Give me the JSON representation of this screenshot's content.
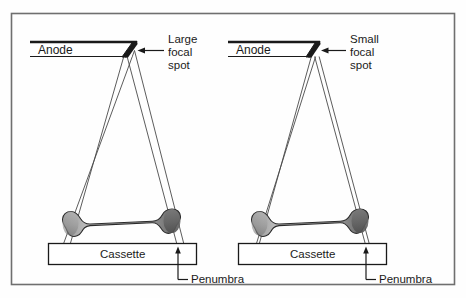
{
  "figure": {
    "type": "diagram",
    "frame": {
      "border_color": "#6f6f6f",
      "background": "#fefefe"
    },
    "colors": {
      "outline": "#1a1a1a",
      "ray_line": "#4a4a4a",
      "bone_light": "#c9c9c9",
      "bone_mid": "#9a9a9a",
      "bone_dark": "#5e5e5e",
      "text": "#1a1a1a"
    },
    "panels": [
      {
        "id": "left",
        "anode_label": "Anode",
        "focal_spot_label": "Large\nfocal\nspot",
        "focal_spot_label_lines": [
          "Large",
          "focal",
          "spot"
        ],
        "cassette_label": "Cassette",
        "penumbra_label": "Penumbra",
        "focal_spot_size": "large",
        "penumbra_size": "wide"
      },
      {
        "id": "right",
        "anode_label": "Anode",
        "focal_spot_label": "Small\nfocal\nspot",
        "focal_spot_label_lines": [
          "Small",
          "focal",
          "spot"
        ],
        "cassette_label": "Cassette",
        "penumbra_label": "Penumbra",
        "focal_spot_size": "small",
        "penumbra_size": "narrow"
      }
    ]
  }
}
